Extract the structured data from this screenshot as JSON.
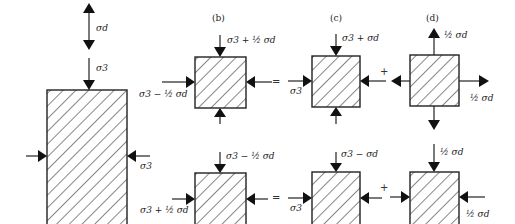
{
  "figure": {
    "panels": [
      {
        "id": "a",
        "label": "",
        "description": "Cylindrical specimen under confining stress and deviator stress"
      },
      {
        "id": "b",
        "label": "(b)"
      },
      {
        "id": "c",
        "label": "(c)"
      },
      {
        "id": "d",
        "label": "(d)"
      }
    ],
    "labels": {
      "sigma_d": "σd",
      "sigma_3": "σ3",
      "b_top_upper": "σ3 + ½ σd",
      "b_left_upper": "σ3 − ½ σd",
      "c_top_upper": "σ3 + σd",
      "c_left_upper": "σ3",
      "d_top_upper": "½ σd",
      "d_right_upper": "½ σd",
      "b_top_lower": "σ3 − ½ σd",
      "b_left_lower": "σ3 + ½ σd",
      "c_top_lower": "σ3 − σd",
      "c_left_lower": "σ3",
      "d_top_lower": "½ σd",
      "d_right_lower": "½ σd",
      "main_right": "σ3",
      "main_left_upper": "σ3 − ½",
      "main_left_lower": "σ3 + ½"
    },
    "operators": {
      "equals": "=",
      "plus": "+"
    }
  }
}
